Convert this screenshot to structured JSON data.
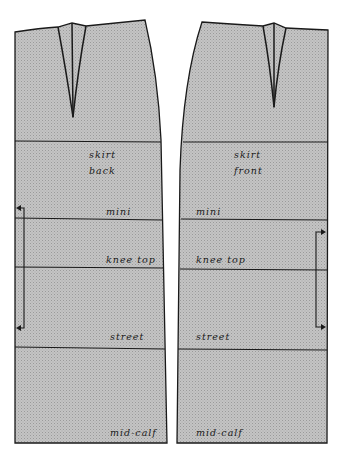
{
  "diagram": {
    "type": "skirt-sewing-pattern",
    "colors": {
      "fill": "#bdbdbd",
      "fill_dot": "#9e9e9e",
      "line": "#1a1a1a",
      "background": "#ffffff"
    },
    "pieces": [
      {
        "id": "back",
        "title_line1": "skirt",
        "title_line2": "back",
        "levels": [
          {
            "name": "hip",
            "label": ""
          },
          {
            "name": "mini",
            "label": "mini"
          },
          {
            "name": "knee-top",
            "label": "knee top"
          },
          {
            "name": "street",
            "label": "street"
          },
          {
            "name": "mid-calf",
            "label": "mid-calf"
          }
        ],
        "grainline": "left side, between mini and street"
      },
      {
        "id": "front",
        "title_line1": "skirt",
        "title_line2": "front",
        "levels": [
          {
            "name": "hip",
            "label": ""
          },
          {
            "name": "mini",
            "label": "mini"
          },
          {
            "name": "knee-top",
            "label": "knee top"
          },
          {
            "name": "street",
            "label": "street"
          },
          {
            "name": "mid-calf",
            "label": "mid-calf"
          }
        ],
        "grainline": "right side, between mini and street"
      }
    ]
  }
}
